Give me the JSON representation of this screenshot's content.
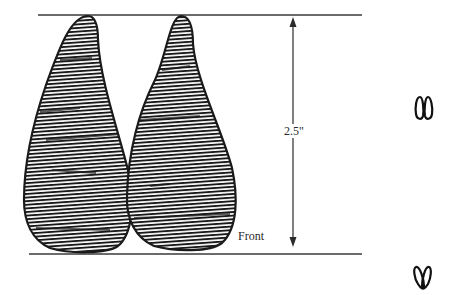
{
  "diagram": {
    "title": "",
    "dimension": {
      "label": "2.5\"",
      "direction": "vertical",
      "orientation_label": "Front"
    },
    "shapes": {
      "left_print": {
        "name": "left-footprint",
        "fill_style": "horizontal hatching",
        "color": "#1a1a1a"
      },
      "right_print": {
        "name": "right-footprint",
        "fill_style": "horizontal hatching",
        "color": "#1a1a1a"
      }
    },
    "icons": [
      {
        "name": "orientation-icon-top",
        "glyph": "two loops, points up"
      },
      {
        "name": "orientation-icon-bottom",
        "glyph": "two loops, crossed at bottom"
      }
    ],
    "colors": {
      "line": "#3a3a3a",
      "ink": "#1a1a1a",
      "background": "#ffffff"
    }
  }
}
